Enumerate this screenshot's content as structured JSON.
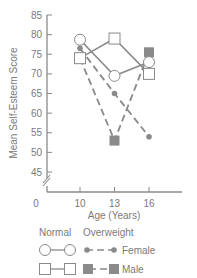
{
  "chart_data": {
    "type": "line",
    "title": "",
    "xlabel": "Age (Years)",
    "ylabel": "Mean Self-Esteem Score",
    "x": [
      10,
      13,
      16
    ],
    "x_tick_labels": [
      "0",
      "10",
      "13",
      "16"
    ],
    "y_tick_labels": [
      "85",
      "80",
      "75",
      "70",
      "65",
      "60",
      "55",
      "50",
      "45"
    ],
    "ylim": [
      45,
      85
    ],
    "y_axis_break": true,
    "grid": false,
    "legend_position": "bottom",
    "legend": {
      "column_headers": [
        "Normal",
        "Overweight"
      ],
      "row_labels": [
        "Female",
        "Male"
      ]
    },
    "series": [
      {
        "name": "Normal Female",
        "group": "Normal",
        "sex": "Female",
        "marker": "open-circle",
        "line": "solid",
        "values": [
          78.7,
          69.5,
          73
        ]
      },
      {
        "name": "Normal Male",
        "group": "Normal",
        "sex": "Male",
        "marker": "open-square",
        "line": "solid",
        "values": [
          74,
          79,
          70
        ]
      },
      {
        "name": "Overweight Female",
        "group": "Overweight",
        "sex": "Female",
        "marker": "filled-circle",
        "line": "dashed",
        "values": [
          76.5,
          65,
          54
        ]
      },
      {
        "name": "Overweight Male",
        "group": "Overweight",
        "sex": "Male",
        "marker": "filled-square",
        "line": "dashed",
        "values": [
          74,
          53,
          75.5
        ]
      }
    ]
  },
  "colors": {
    "line": "#8a8a8a",
    "marker_fill": "#8a8a8a",
    "open_marker_fill": "#ffffff",
    "text": "#7a7a7a"
  }
}
